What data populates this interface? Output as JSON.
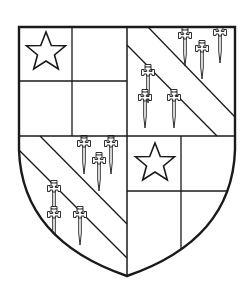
{
  "image": {
    "subject": "Heraldic shield, quarterly",
    "background": "#ffffff",
    "ink": "#1a1a1a"
  },
  "shield": {
    "quarters": [
      {
        "position": "1st (dexter chief)",
        "design": "quarterly with mullet (star) in first square"
      },
      {
        "position": "2nd (sinister chief)",
        "design": "bend between six cross-crosslets fitchy"
      },
      {
        "position": "3rd (dexter base)",
        "design": "bend between six cross-crosslets fitchy"
      },
      {
        "position": "4th (sinister base)",
        "design": "quarterly with mullet (star) in first square"
      }
    ],
    "charges": {
      "mullets": 2,
      "cross_crosslets": 12,
      "bends": 2
    }
  }
}
